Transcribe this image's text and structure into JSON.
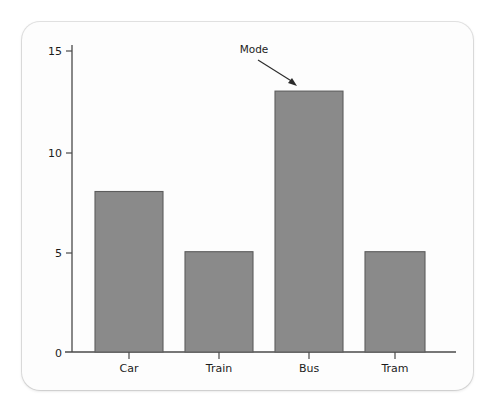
{
  "chart_data": {
    "type": "bar",
    "title": "",
    "xlabel": "",
    "ylabel": "",
    "categories": [
      "Car",
      "Train",
      "Bus",
      "Tram"
    ],
    "values": [
      8,
      5,
      13,
      5
    ],
    "ylim": [
      0,
      15
    ],
    "yticks": [
      0,
      5,
      10,
      15
    ],
    "ytick_labels": [
      "0",
      "5",
      "10",
      "15"
    ],
    "grid": false,
    "legend": null,
    "annotations": [
      {
        "text": "Mode",
        "points_to_category": "Bus",
        "points_to_value": 13,
        "arrow": true
      }
    ],
    "colors": {
      "bar_fill": "#8a8a8a",
      "bar_edge": "#5d5d5d",
      "axis": "#4a4a4a",
      "text": "#1c1c1c",
      "card_background": "#fdfdfd",
      "page_background": "#ffffff"
    }
  },
  "axis": {
    "y_tick_0": "0",
    "y_tick_5": "5",
    "y_tick_10": "10",
    "y_tick_15": "15"
  },
  "categories": {
    "c0": "Car",
    "c1": "Train",
    "c2": "Bus",
    "c3": "Tram"
  },
  "annotation": {
    "mode_label": "Mode"
  }
}
